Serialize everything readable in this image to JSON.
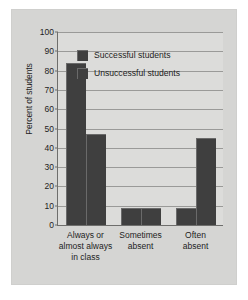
{
  "chart_data": {
    "type": "bar",
    "title": "",
    "xlabel": "",
    "ylabel": "Percent of students",
    "ylim": [
      0,
      100
    ],
    "yticks": [
      0,
      10,
      20,
      30,
      40,
      50,
      60,
      70,
      80,
      90,
      100
    ],
    "ytick_labels": [
      "0",
      "10",
      "20",
      "30",
      "40",
      "50",
      "60",
      "70",
      "80",
      "90",
      "100"
    ],
    "grid": "horizontal",
    "legend_position": "upper-center",
    "categories": [
      "Always or\nalmost always\nin class",
      "Sometimes\nabsent",
      "Often\nabsent"
    ],
    "category_lines": [
      [
        "Always or",
        "almost always",
        "in class"
      ],
      [
        "Sometimes",
        "absent"
      ],
      [
        "Often",
        "absent"
      ]
    ],
    "series": [
      {
        "name": "Successful students",
        "values": [
          84,
          9,
          9
        ]
      },
      {
        "name": "Unsuccessful students",
        "values": [
          47,
          9,
          45
        ]
      }
    ],
    "colors": {
      "bar": "#3f3f3f",
      "bar_highlight": "#6a6a6a",
      "plot_background": "#dcdcda",
      "panel_background": "#d5d5d3",
      "gridline": "#9a9a98",
      "axis": "#6e6e6c",
      "text": "#1d1d1d",
      "page_background": "#ffffff"
    }
  }
}
